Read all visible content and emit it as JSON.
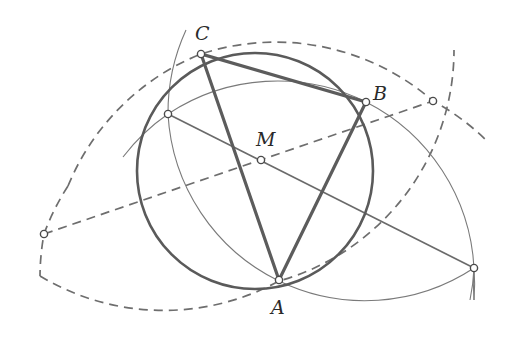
{
  "diagram": {
    "type": "geometric-construction",
    "colors": {
      "background": "#ffffff",
      "stroke": "#5c5c5c",
      "label": "#2a2a2a"
    },
    "points": {
      "A": {
        "label": "A",
        "x": 279,
        "y": 280
      },
      "B": {
        "label": "B",
        "x": 366,
        "y": 102
      },
      "C": {
        "label": "C",
        "x": 201,
        "y": 54
      },
      "M": {
        "label": "M",
        "x": 261,
        "y": 160
      },
      "P1": {
        "label": "",
        "x": 168,
        "y": 114
      },
      "P2": {
        "label": "",
        "x": 474,
        "y": 268
      },
      "P3": {
        "label": "",
        "x": 44,
        "y": 234
      },
      "P4": {
        "label": "",
        "x": 433,
        "y": 101
      }
    },
    "labels": {
      "A": "A",
      "B": "B",
      "C": "C",
      "M": "M"
    },
    "elements": [
      {
        "type": "circle",
        "name": "circumcircle",
        "through": [
          "A",
          "B",
          "C"
        ],
        "style": "thick"
      },
      {
        "type": "triangle",
        "name": "triangle-ABC",
        "vertices": [
          "A",
          "B",
          "C"
        ],
        "style": "thick"
      },
      {
        "type": "arc",
        "name": "arc-center-B",
        "center": "B",
        "through": [
          "P1",
          "A",
          "P2"
        ],
        "style": "thin"
      },
      {
        "type": "arc",
        "name": "arc-center-A",
        "center": "A",
        "through": [
          "P1",
          "B",
          "P2"
        ],
        "style": "thin"
      },
      {
        "type": "arc",
        "name": "dashed-arc-center-A",
        "center": "A",
        "through": [
          "P3",
          "C",
          "P4"
        ],
        "style": "dashed"
      },
      {
        "type": "arc",
        "name": "dashed-arc-center-C",
        "center": "C",
        "through": [
          "P3",
          "A",
          "P4"
        ],
        "style": "dashed"
      },
      {
        "type": "line",
        "name": "line-P1-M-P2",
        "through": [
          "P1",
          "M",
          "P2"
        ],
        "style": "solid"
      },
      {
        "type": "line",
        "name": "dashed-line-P3-M-P4",
        "through": [
          "P3",
          "M",
          "P4"
        ],
        "style": "dashed"
      }
    ]
  }
}
